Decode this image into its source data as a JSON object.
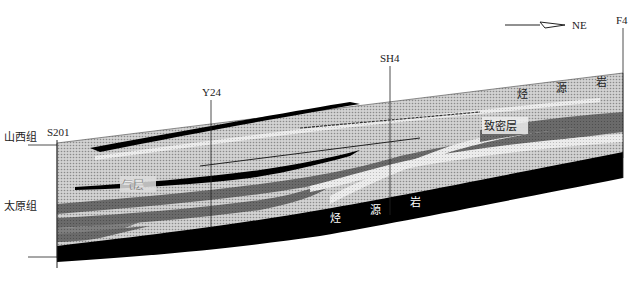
{
  "compass": {
    "direction": "NE"
  },
  "wells": [
    {
      "id": "S201",
      "x": 57
    },
    {
      "id": "Y24",
      "x": 211
    },
    {
      "id": "SH4",
      "x": 390
    },
    {
      "id": "F4",
      "x": 623
    }
  ],
  "formations": [
    {
      "name": "山西组"
    },
    {
      "name": "太原组"
    }
  ],
  "labels": {
    "gas_layer": "气层",
    "tight_layer": "致密层",
    "source_rock_upper": [
      "烃",
      "源",
      "岩"
    ],
    "source_rock_lower": [
      "烃",
      "源",
      "岩"
    ]
  },
  "colors": {
    "sandstone": "#c8c8c8",
    "dark_band": "#6e6e6e",
    "light_band": "#e6e6e6",
    "coal": "#000000"
  }
}
